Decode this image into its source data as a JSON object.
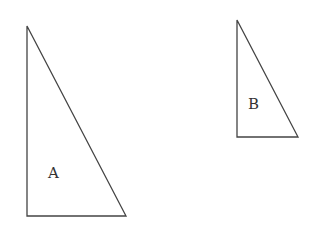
{
  "diagram": {
    "shapes": [
      {
        "label": "A",
        "type": "right-triangle",
        "points": [
          [
            27,
            26
          ],
          [
            27,
            216
          ],
          [
            126,
            216
          ]
        ],
        "label_pos": [
          48,
          178
        ]
      },
      {
        "label": "B",
        "type": "right-triangle",
        "points": [
          [
            237,
            20
          ],
          [
            237,
            137
          ],
          [
            298,
            137
          ]
        ],
        "label_pos": [
          248,
          109
        ]
      }
    ],
    "stroke_color": "#444444"
  }
}
